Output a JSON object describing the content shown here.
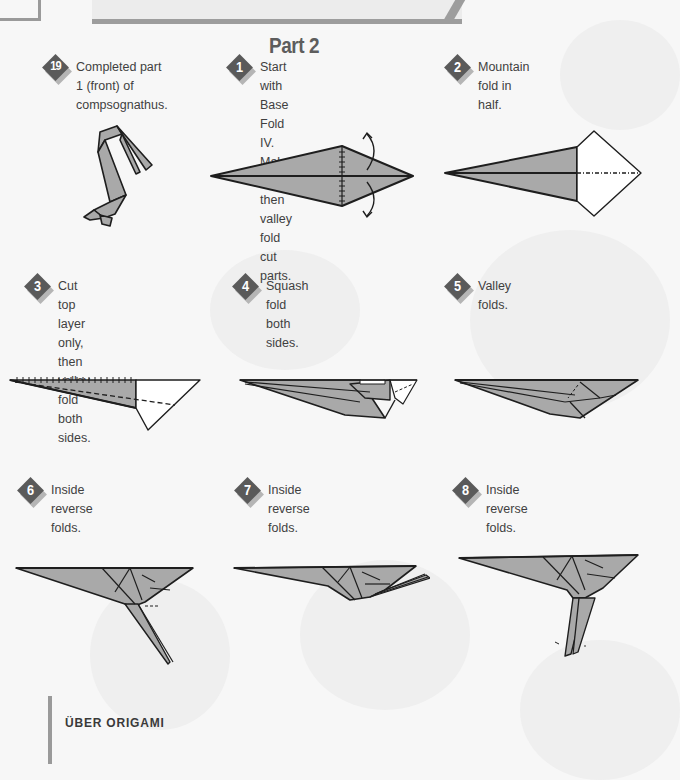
{
  "page": {
    "part_title": "Part 2",
    "footer_title": "ÜBER ORIGAMI"
  },
  "steps": [
    {
      "number": "19",
      "text": "Completed part 1 (front) of\ncompsognathus.",
      "diagram": "completed-part-1-figure"
    },
    {
      "number": "1",
      "text": "Start with Base Fold IV.\nMake cuts, then valley\nfold cut parts.",
      "diagram": "base-fold-iv-kite"
    },
    {
      "number": "2",
      "text": "Mountain fold in half.",
      "diagram": "mountain-fold-kite"
    },
    {
      "number": "3",
      "text": "Cut top layer only, then\nvalley fold both sides.",
      "diagram": "cut-top-layer-figure"
    },
    {
      "number": "4",
      "text": "Squash fold both sides.",
      "diagram": "squash-fold-figure"
    },
    {
      "number": "5",
      "text": "Valley folds.",
      "diagram": "valley-folds-figure"
    },
    {
      "number": "6",
      "text": "Inside reverse folds.",
      "diagram": "inside-reverse-fold-figure-6"
    },
    {
      "number": "7",
      "text": "Inside reverse folds.",
      "diagram": "inside-reverse-fold-figure-7"
    },
    {
      "number": "8",
      "text": "Inside reverse folds.",
      "diagram": "inside-reverse-fold-figure-8"
    }
  ],
  "colors": {
    "paper_fill": "#a9a9a9",
    "line": "#1e1e1e",
    "badge": "#5a5a5a",
    "badge_shadow": "#b5b5b5",
    "background": "#f7f7f7"
  }
}
